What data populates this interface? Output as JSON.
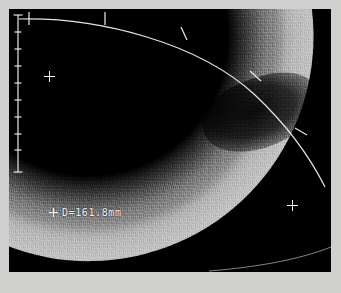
{
  "modality": "ultrasound-b-mode",
  "viewport": {
    "background_color": "#000000",
    "frame_color": "#cfcfcd",
    "width": 322,
    "height": 263
  },
  "measurement": {
    "caliper_icon": "caliper-cross-icon",
    "label": "D=161.8mm",
    "value": "161.8",
    "unit": "mm",
    "parameter": "D",
    "text_color": "#f2f2f2"
  },
  "calipers": [
    {
      "name": "caliper-point-1",
      "icon": "cross-marker-icon",
      "x": 40,
      "y": 67
    },
    {
      "name": "caliper-point-2",
      "icon": "cross-marker-icon",
      "x": 283,
      "y": 196
    }
  ],
  "depth_ruler": {
    "name": "depth-scale",
    "orientation": "vertical",
    "color": "#e8e8e8",
    "tick_count": 9
  },
  "boundary_arc": {
    "name": "tissue-boundary-arc",
    "color": "#f0f0f0",
    "tick_count": 5,
    "description": "probe-skin interface arc with perpendicular graduation ticks"
  },
  "tissue": {
    "layers": [
      {
        "name": "superficial-echogenic-band",
        "echogenicity": "hyperechoic"
      },
      {
        "name": "hypoechoic-plane",
        "echogenicity": "hypoechoic"
      },
      {
        "name": "deep-echogenic-body",
        "echogenicity": "mixed"
      },
      {
        "name": "acoustic-shadow",
        "echogenicity": "anechoic"
      }
    ]
  }
}
